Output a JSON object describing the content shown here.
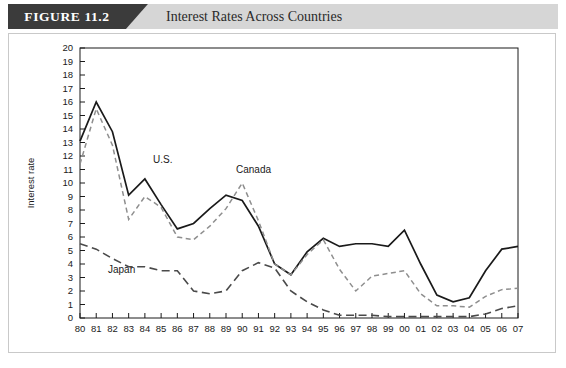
{
  "header": {
    "figure_tag": "FIGURE 11.2",
    "title": "Interest Rates Across Countries"
  },
  "axes": {
    "ylabel": "Interest rate",
    "xlabel": "Year",
    "yticks": [
      "0",
      "1",
      "2",
      "3",
      "4",
      "5",
      "6",
      "7",
      "8",
      "9",
      "10",
      "11",
      "12",
      "13",
      "14",
      "15",
      "16",
      "17",
      "18",
      "19",
      "20"
    ],
    "xticks": [
      "80",
      "81",
      "82",
      "83",
      "84",
      "85",
      "86",
      "87",
      "88",
      "89",
      "90",
      "91",
      "92",
      "93",
      "94",
      "95",
      "96",
      "97",
      "98",
      "99",
      "00",
      "01",
      "02",
      "03",
      "04",
      "05",
      "06",
      "07"
    ]
  },
  "annotations": {
    "us": "U.S.",
    "canada": "Canada",
    "japan": "Japan"
  },
  "colors": {
    "canada": "#1a1a1a",
    "us": "#8e8e8e",
    "japan": "#4a4a4a",
    "tag_band": "#3b3b3b",
    "title_band": "#d6d6d6",
    "frame": "#c9c9c9"
  },
  "chart_data": {
    "type": "line",
    "title": "Interest Rates Across Countries",
    "xlabel": "Year",
    "ylabel": "Interest rate",
    "ylim": [
      0,
      20
    ],
    "ytick_step": 1,
    "grid": false,
    "legend": "inline annotations",
    "x": [
      "80",
      "81",
      "82",
      "83",
      "84",
      "85",
      "86",
      "87",
      "88",
      "89",
      "90",
      "91",
      "92",
      "93",
      "94",
      "95",
      "96",
      "97",
      "98",
      "99",
      "00",
      "01",
      "02",
      "03",
      "04",
      "05",
      "06",
      "07"
    ],
    "series": [
      {
        "name": "Canada",
        "style": "solid",
        "color": "#1a1a1a",
        "values": [
          13.1,
          16.0,
          13.8,
          9.1,
          10.3,
          8.4,
          6.6,
          7.0,
          8.1,
          9.1,
          8.7,
          6.8,
          4.0,
          3.2,
          4.9,
          5.9,
          5.3,
          5.5,
          5.5,
          5.3,
          6.5,
          4.0,
          1.7,
          1.2,
          1.5,
          3.5,
          5.1,
          5.3
        ]
      },
      {
        "name": "U.S.",
        "style": "dashed",
        "color": "#8e8e8e",
        "values": [
          11.4,
          15.5,
          12.8,
          7.3,
          9.0,
          8.2,
          6.0,
          5.8,
          6.8,
          8.1,
          10.0,
          7.2,
          4.0,
          3.2,
          4.7,
          5.8,
          3.6,
          2.0,
          3.1,
          3.3,
          3.5,
          1.8,
          0.9,
          0.9,
          0.8,
          1.6,
          2.1,
          2.2
        ]
      },
      {
        "name": "Japan",
        "style": "long-dashed",
        "color": "#4a4a4a",
        "values": [
          5.5,
          5.1,
          4.4,
          3.8,
          3.8,
          3.5,
          3.5,
          2.0,
          1.8,
          2.0,
          3.5,
          4.1,
          3.7,
          2.0,
          1.2,
          0.6,
          0.2,
          0.2,
          0.2,
          0.1,
          0.1,
          0.1,
          0.1,
          0.1,
          0.1,
          0.3,
          0.7,
          0.9
        ]
      }
    ]
  }
}
